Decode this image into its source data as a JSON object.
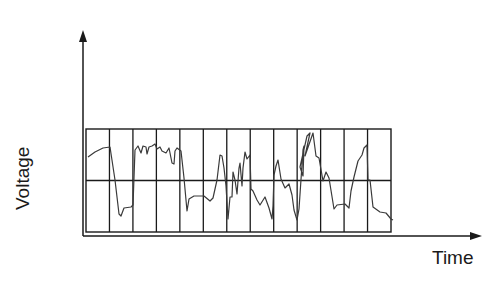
{
  "diagram": {
    "type": "oscilloscope-waveform",
    "y_axis_label": "Voltage",
    "x_axis_label": "Time",
    "colors": {
      "axis": "#1a1a1a",
      "grid": "#1a1a1a",
      "trace": "#3a3a3a",
      "background": "#ffffff"
    },
    "grid": {
      "columns": 13,
      "rows": 2,
      "left": 86,
      "top": 129,
      "right": 391,
      "bottom": 232
    },
    "axes": {
      "y": {
        "x": 83,
        "top": 30,
        "bottom": 236
      },
      "x": {
        "y": 236,
        "left": 83,
        "right": 482
      }
    },
    "trace_points": [
      [
        88,
        157
      ],
      [
        95,
        152
      ],
      [
        103,
        148
      ],
      [
        110,
        147
      ],
      [
        115,
        180
      ],
      [
        119,
        214
      ],
      [
        121,
        216
      ],
      [
        124,
        208
      ],
      [
        131,
        207
      ],
      [
        133,
        205
      ],
      [
        135,
        150
      ],
      [
        138,
        146
      ],
      [
        141,
        153
      ],
      [
        143,
        146
      ],
      [
        146,
        147
      ],
      [
        147,
        154
      ],
      [
        149,
        147
      ],
      [
        152,
        146
      ],
      [
        155,
        144
      ],
      [
        157,
        149
      ],
      [
        160,
        147
      ],
      [
        162,
        151
      ],
      [
        166,
        153
      ],
      [
        169,
        148
      ],
      [
        172,
        163
      ],
      [
        174,
        164
      ],
      [
        175,
        151
      ],
      [
        177,
        148
      ],
      [
        181,
        151
      ],
      [
        184,
        178
      ],
      [
        187,
        211
      ],
      [
        189,
        199
      ],
      [
        194,
        196
      ],
      [
        200,
        196
      ],
      [
        204,
        196
      ],
      [
        210,
        201
      ],
      [
        213,
        198
      ],
      [
        217,
        180
      ],
      [
        220,
        155
      ],
      [
        222,
        156
      ],
      [
        224,
        168
      ],
      [
        226,
        186
      ],
      [
        228,
        219
      ],
      [
        230,
        197
      ],
      [
        232,
        197
      ],
      [
        233,
        172
      ],
      [
        235,
        180
      ],
      [
        237,
        194
      ],
      [
        239,
        168
      ],
      [
        240,
        163
      ],
      [
        242,
        186
      ],
      [
        243,
        168
      ],
      [
        245,
        152
      ],
      [
        247,
        159
      ],
      [
        250,
        155
      ],
      [
        251,
        189
      ],
      [
        253,
        191
      ],
      [
        257,
        200
      ],
      [
        260,
        205
      ],
      [
        265,
        197
      ],
      [
        269,
        208
      ],
      [
        272,
        219
      ],
      [
        273,
        206
      ],
      [
        274,
        175
      ],
      [
        276,
        166
      ],
      [
        278,
        160
      ],
      [
        281,
        179
      ],
      [
        285,
        188
      ],
      [
        289,
        184
      ],
      [
        292,
        195
      ],
      [
        294,
        210
      ],
      [
        297,
        220
      ],
      [
        299,
        209
      ],
      [
        303,
        150
      ],
      [
        304,
        146
      ],
      [
        303,
        176
      ],
      [
        300,
        167
      ],
      [
        307,
        136
      ],
      [
        310,
        133
      ],
      [
        305,
        156
      ],
      [
        313,
        133
      ],
      [
        316,
        156
      ],
      [
        319,
        158
      ],
      [
        323,
        181
      ],
      [
        326,
        172
      ],
      [
        329,
        178
      ],
      [
        334,
        209
      ],
      [
        337,
        205
      ],
      [
        345,
        204
      ],
      [
        349,
        208
      ],
      [
        351,
        191
      ],
      [
        354,
        177
      ],
      [
        358,
        161
      ],
      [
        362,
        155
      ],
      [
        364,
        148
      ],
      [
        367,
        145
      ],
      [
        368,
        180
      ],
      [
        370,
        180
      ],
      [
        373,
        207
      ],
      [
        380,
        212
      ],
      [
        386,
        213
      ],
      [
        391,
        219
      ],
      [
        393,
        220
      ]
    ]
  }
}
